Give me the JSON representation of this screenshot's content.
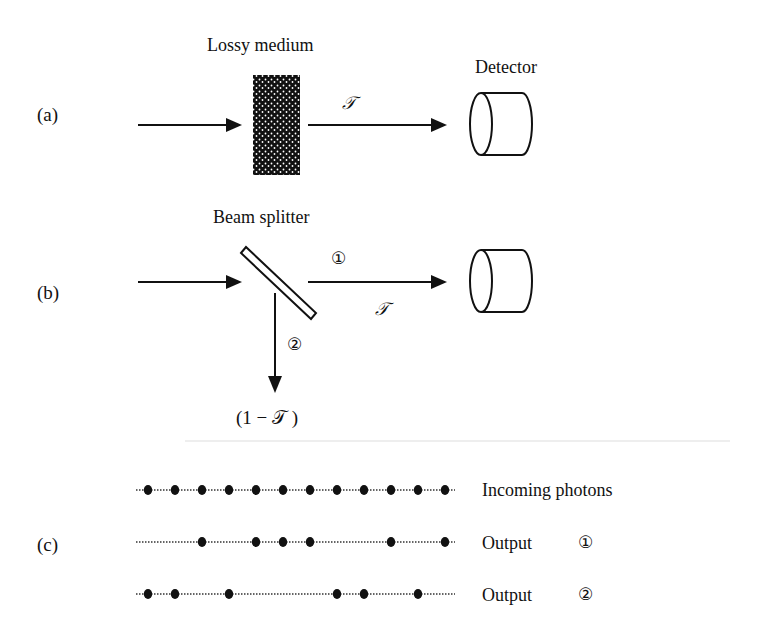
{
  "panels": {
    "a": {
      "label": "(a)",
      "medium_label": "Lossy medium",
      "transmission_symbol": "𝒯",
      "detector_label": "Detector"
    },
    "b": {
      "label": "(b)",
      "splitter_label": "Beam splitter",
      "output1_marker": "①",
      "output2_marker": "②",
      "transmission_symbol": "𝒯",
      "reflection_label": "(1 − 𝒯 )"
    },
    "c": {
      "label": "(c)",
      "rows": [
        {
          "label": "Incoming photons",
          "marker": "",
          "photons": [
            1,
            2,
            3,
            4,
            5,
            6,
            7,
            8,
            9,
            10,
            11,
            12
          ]
        },
        {
          "label": "Output",
          "marker": "①",
          "photons": [
            3,
            5,
            6,
            7,
            10,
            12
          ]
        },
        {
          "label": "Output",
          "marker": "②",
          "photons": [
            1,
            2,
            4,
            8,
            9,
            11
          ]
        }
      ]
    }
  },
  "colors": {
    "ink": "#111111",
    "background": "#ffffff"
  }
}
